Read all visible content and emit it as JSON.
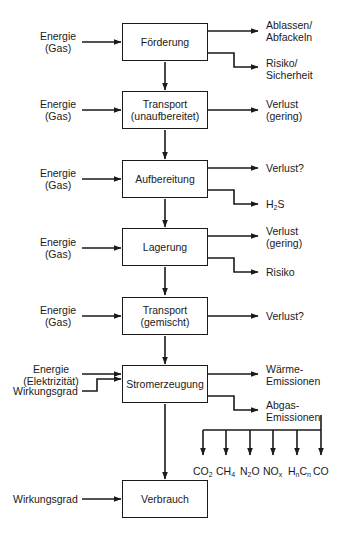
{
  "process_steps": [
    {
      "id": "foerderung",
      "line1": "Förderung",
      "line2": ""
    },
    {
      "id": "transport_unaufbereitet",
      "line1": "Transport",
      "line2": "(unaufbereitet)"
    },
    {
      "id": "aufbereitung",
      "line1": "Aufbereitung",
      "line2": ""
    },
    {
      "id": "lagerung",
      "line1": "Lagerung",
      "line2": ""
    },
    {
      "id": "transport_gemischt",
      "line1": "Transport",
      "line2": "(gemischt)"
    },
    {
      "id": "stromerzeugung",
      "line1": "Stromerzeugung",
      "line2": ""
    },
    {
      "id": "verbrauch",
      "line1": "Verbrauch",
      "line2": ""
    }
  ],
  "inputs": [
    {
      "line1": "Energie",
      "line2": "(Gas)"
    },
    {
      "line1": "Energie",
      "line2": "(Gas)"
    },
    {
      "line1": "Energie",
      "line2": "(Gas)"
    },
    {
      "line1": "Energie",
      "line2": "(Gas)"
    },
    {
      "line1": "Energie",
      "line2": "(Gas)"
    },
    {
      "line1": "Energie",
      "line2": "(Elektrizität)"
    },
    {
      "line1": "Wirkungsgrad",
      "line2": ""
    },
    {
      "line1": "Wirkungsgrad",
      "line2": ""
    }
  ],
  "outputs": [
    {
      "line1": "Ablassen/",
      "line2": "Abfackeln"
    },
    {
      "line1": "Risiko/",
      "line2": "Sicherheit"
    },
    {
      "line1": "Verlust",
      "line2": "(gering)"
    },
    {
      "line1": "Verlust?",
      "line2": ""
    },
    {
      "line1": "H2S",
      "line2": ""
    },
    {
      "line1": "Verlust",
      "line2": "(gering)"
    },
    {
      "line1": "Risiko",
      "line2": ""
    },
    {
      "line1": "Verlust?",
      "line2": ""
    },
    {
      "line1": "Wärme-",
      "line2": "Emissionen"
    },
    {
      "line1": "Abgas-",
      "line2": "Emissionen"
    }
  ],
  "emissions": [
    {
      "base": "CO",
      "sub": "2",
      "tail": ""
    },
    {
      "base": "CH",
      "sub": "4",
      "tail": ""
    },
    {
      "base": "N",
      "sub": "2",
      "tail": "O"
    },
    {
      "base": "NO",
      "sub": "x",
      "tail": ""
    },
    {
      "base": "H",
      "sub": "n",
      "tail": "C",
      "sub2": "n"
    },
    {
      "base": "CO",
      "sub": "",
      "tail": ""
    }
  ]
}
